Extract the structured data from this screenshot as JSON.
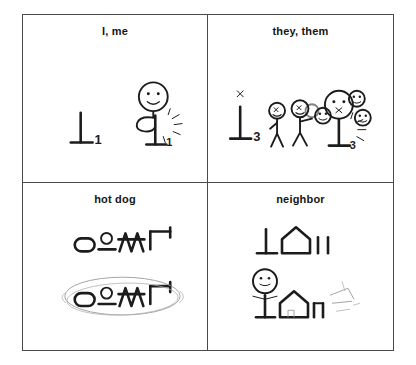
{
  "page": {
    "background": "#ffffff",
    "ink_color": "#1c1c1c",
    "border_color": "#4a4a4a",
    "faint_color": "#9a9a9a"
  },
  "grid": {
    "rows": 2,
    "columns": 2,
    "cells": [
      {
        "id": "i-me",
        "position": "top-left",
        "title": "I, me",
        "glyph_label": "1",
        "glyph_symbol": "perpendicular-one",
        "figure_expression": "smile",
        "figure_action": "pointing-at-self",
        "motion_marks": true
      },
      {
        "id": "they-them",
        "position": "top-right",
        "title": "they, them",
        "glyph_label": "3",
        "glyph_symbol": "perpendicular-three",
        "glyph_mark_above": "x",
        "figure_expression": "x-eyes",
        "figure_count": 2,
        "face_count": 4,
        "motion_marks": true
      },
      {
        "id": "hot-dog",
        "position": "bottom-left",
        "title": "hot dog",
        "glyph_sequence": [
          "oval",
          "circle-over-bar",
          "double-peak",
          "rotated-h"
        ],
        "repeat_rows": 2,
        "lasso_on_second_row": true
      },
      {
        "id": "neighbor",
        "position": "bottom-right",
        "title": "neighbor",
        "glyph_sequence": [
          "perpendicular",
          "house",
          "tick",
          "tick"
        ],
        "figure_expression": "smile",
        "figure_action": "standing-beside-house",
        "sketch_marks": true
      }
    ]
  }
}
